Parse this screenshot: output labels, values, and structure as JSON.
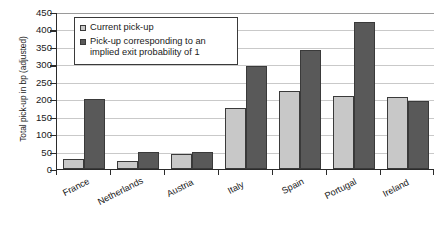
{
  "chart_data": {
    "type": "bar",
    "title": "",
    "xlabel": "",
    "ylabel": "Total pick-up in bp (adjusted)",
    "ylim": [
      0,
      450
    ],
    "ytick_step": 50,
    "yticks": [
      450,
      400,
      350,
      300,
      250,
      200,
      150,
      100,
      50,
      0
    ],
    "grid": true,
    "legend_position": "top-left-inside",
    "categories": [
      "France",
      "Netherlands",
      "Austria",
      "Italy",
      "Spain",
      "Portugal",
      "Ireland"
    ],
    "series": [
      {
        "name": "Current pick-up",
        "color": "#c8c8c8",
        "values": [
          30,
          22,
          43,
          175,
          225,
          210,
          205
        ]
      },
      {
        "name": "Pick-up corresponding to an implied exit probability of 1",
        "color": "#595959",
        "values": [
          200,
          50,
          50,
          295,
          340,
          420,
          195
        ]
      }
    ]
  },
  "legend": {
    "entries": [
      {
        "label": "Current pick-up",
        "swatch": "light"
      },
      {
        "label": "Pick-up corresponding to an implied exit probability of 1",
        "swatch": "dark"
      }
    ]
  },
  "colors": {
    "series_light": "#c8c8c8",
    "series_dark": "#595959",
    "axis": "#2b2b2b",
    "gridline": "#c9c9c9",
    "background": "#ffffff"
  }
}
